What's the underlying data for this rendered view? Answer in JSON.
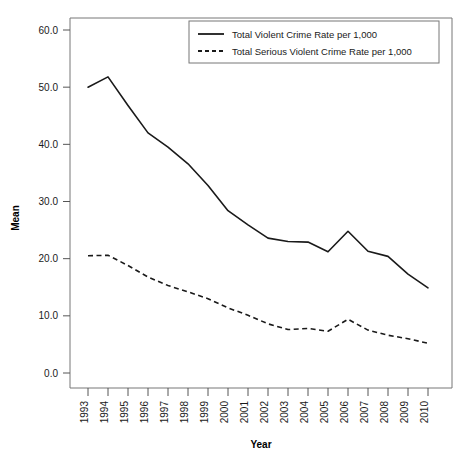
{
  "chart_data": {
    "type": "line",
    "title": "",
    "xlabel": "Year",
    "ylabel": "Mean",
    "grid": false,
    "legend_position": "top-right",
    "xlim": [
      1993,
      2010
    ],
    "ylim": [
      0.0,
      60.0
    ],
    "x": [
      1993,
      1994,
      1995,
      1996,
      1997,
      1998,
      1999,
      2000,
      2001,
      2002,
      2003,
      2004,
      2005,
      2006,
      2007,
      2008,
      2009,
      2010
    ],
    "categories": [
      "1993",
      "1994",
      "1995",
      "1996",
      "1997",
      "1998",
      "1999",
      "2000",
      "2001",
      "2002",
      "2003",
      "2004",
      "2005",
      "2006",
      "2007",
      "2008",
      "2009",
      "2010"
    ],
    "ytick_labels": [
      "0.0",
      "10.0",
      "20.0",
      "30.0",
      "40.0",
      "50.0",
      "60.0"
    ],
    "ytick_values": [
      0.0,
      10.0,
      20.0,
      30.0,
      40.0,
      50.0,
      60.0
    ],
    "series": [
      {
        "name": "Total Violent Crime Rate per 1,000",
        "style": "solid",
        "color": "#1a1a1a",
        "values": [
          50.0,
          51.8,
          46.8,
          42.0,
          39.5,
          36.6,
          32.8,
          28.4,
          25.9,
          23.6,
          23.0,
          22.9,
          21.2,
          24.8,
          21.3,
          20.4,
          17.3,
          14.9
        ]
      },
      {
        "name": "Total Serious Violent Crime Rate per 1,000",
        "style": "dashed",
        "color": "#1a1a1a",
        "values": [
          20.5,
          20.6,
          18.8,
          16.8,
          15.3,
          14.2,
          13.0,
          11.4,
          10.1,
          8.6,
          7.6,
          7.8,
          7.3,
          9.4,
          7.5,
          6.6,
          6.0,
          5.2
        ]
      }
    ]
  },
  "legend": {
    "entries": [
      {
        "label": "Total Violent Crime Rate per 1,000",
        "style": "solid"
      },
      {
        "label": "Total Serious Violent Crime Rate per 1,000",
        "style": "dashed"
      }
    ]
  },
  "axes": {
    "x_title": "Year",
    "y_title": "Mean"
  }
}
